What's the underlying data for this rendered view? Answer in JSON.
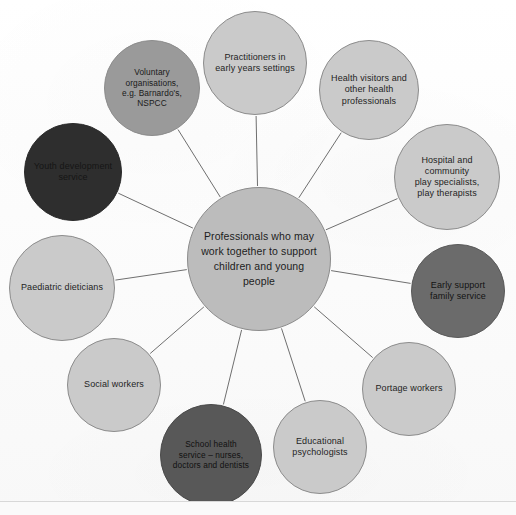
{
  "diagram": {
    "type": "hub-and-spoke",
    "center": {
      "id": "center",
      "label": "Professionals who may\nwork together to support\nchildren and young people",
      "color": "#bcbcbc",
      "cx": 259,
      "cy": 259,
      "r": 72
    },
    "nodes": [
      {
        "id": "practitioners-early-years",
        "label": "Practitioners in\nearly years settings",
        "color": "#cacaca",
        "shade": "light",
        "size": "sm",
        "cx": 255,
        "cy": 63,
        "r": 52
      },
      {
        "id": "health-visitors",
        "label": "Health visitors and\nother health\nprofessionals",
        "color": "#cacaca",
        "shade": "light",
        "size": "sm",
        "cx": 369,
        "cy": 90,
        "r": 50
      },
      {
        "id": "hospital-play-specialists",
        "label": "Hospital and\ncommunity\nplay specialists,\nplay therapists",
        "color": "#cacaca",
        "shade": "light",
        "size": "sm",
        "cx": 447,
        "cy": 177,
        "r": 53
      },
      {
        "id": "early-support-family-service",
        "label": "Early support\nfamily service",
        "color": "#6b6b6b",
        "shade": "dark",
        "size": "sm",
        "cx": 458,
        "cy": 291,
        "r": 47
      },
      {
        "id": "portage-workers",
        "label": "Portage workers",
        "color": "#cacaca",
        "shade": "light",
        "size": "sm",
        "cx": 409,
        "cy": 389,
        "r": 47
      },
      {
        "id": "educational-psychologists",
        "label": "Educational\npsychologists",
        "color": "#cacaca",
        "shade": "light",
        "size": "sm",
        "cx": 320,
        "cy": 447,
        "r": 47
      },
      {
        "id": "school-health-service",
        "label": "School health\nservice – nurses,\ndoctors and dentists",
        "color": "#585858",
        "shade": "darker",
        "size": "xs",
        "cx": 211,
        "cy": 455,
        "r": 51
      },
      {
        "id": "social-workers",
        "label": "Social workers",
        "color": "#cacaca",
        "shade": "light",
        "size": "sm",
        "cx": 114,
        "cy": 385,
        "r": 47
      },
      {
        "id": "paediatric-dieticians",
        "label": "Paediatric dieticians",
        "color": "#cacaca",
        "shade": "light",
        "size": "sm",
        "cx": 62,
        "cy": 288,
        "r": 53
      },
      {
        "id": "youth-development-service",
        "label": "Youth development\nservice",
        "color": "#2e2e2e",
        "shade": "blackish",
        "size": "sm",
        "cx": 73,
        "cy": 172,
        "r": 49
      },
      {
        "id": "voluntary-organisations",
        "label": "Voluntary\norganisations,\ne.g. Barnardo's,\nNSPCC",
        "color": "#9a9a9a",
        "shade": "mid",
        "size": "xs",
        "cx": 152,
        "cy": 88,
        "r": 48
      }
    ],
    "edge_color": "#6f6f6f"
  }
}
